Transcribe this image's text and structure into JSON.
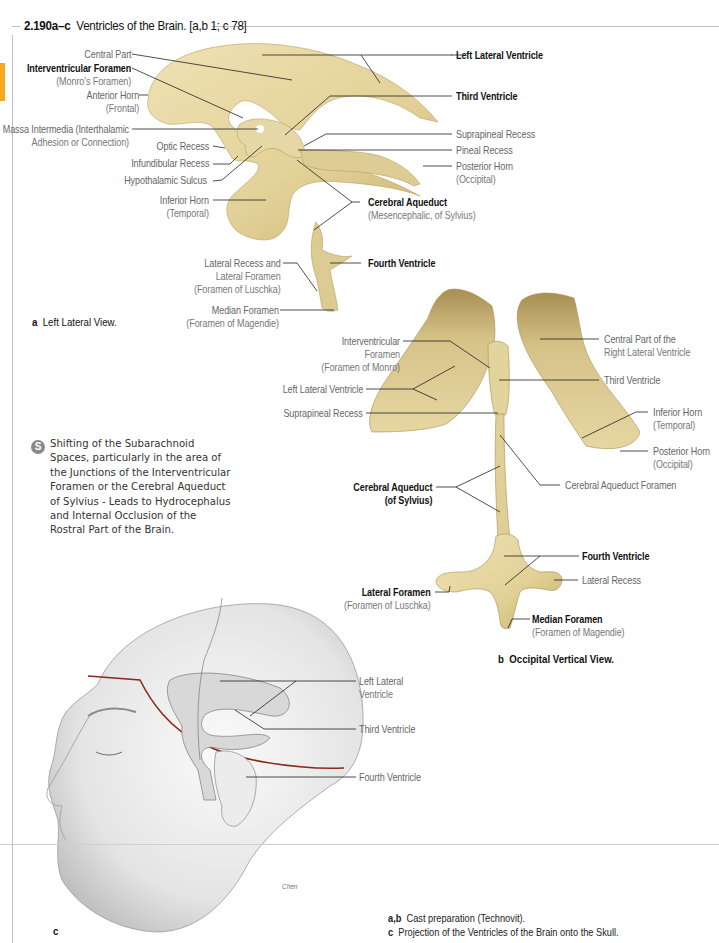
{
  "figure": {
    "number": "2.190a–c",
    "title": "Ventricles of the Brain. [a,b 1; c 78]",
    "accent_color": "#f7a823",
    "cast_color": "#e8d9a6",
    "cast_shadow": "#c9b277"
  },
  "panel_a": {
    "caption_letter": "a",
    "caption_text": "Left Lateral View.",
    "labels": [
      {
        "main": "Central Part",
        "sub": "",
        "bold": false
      },
      {
        "main": "Interventricular Foramen",
        "sub": "(Monro's Foramen)",
        "bold": true
      },
      {
        "main": "Anterior Horn",
        "sub": "(Frontal)",
        "bold": false
      },
      {
        "main": "Massa Intermedia (Interthalamic",
        "sub": "Adhesion or Connection)",
        "bold": false
      },
      {
        "main": "Optic Recess",
        "sub": "",
        "bold": false
      },
      {
        "main": "Infundibular Recess",
        "sub": "",
        "bold": false
      },
      {
        "main": "Hypothalamic Sulcus",
        "sub": "",
        "bold": false
      },
      {
        "main": "Inferior Horn",
        "sub": "(Temporal)",
        "bold": false
      },
      {
        "main": "Lateral Recess and",
        "sub": "Lateral Foramen",
        "sub2": "(Foramen of Luschka)",
        "bold": false
      },
      {
        "main": "Median Foramen",
        "sub": "(Foramen of Magendie)",
        "bold": false
      },
      {
        "main": "Left Lateral Ventricle",
        "sub": "",
        "bold": true
      },
      {
        "main": "Third Ventricle",
        "sub": "",
        "bold": true
      },
      {
        "main": "Suprapineal Recess",
        "sub": "",
        "bold": false
      },
      {
        "main": "Pineal Recess",
        "sub": "",
        "bold": false
      },
      {
        "main": "Posterior Horn",
        "sub": "(Occipital)",
        "bold": false
      },
      {
        "main": "Cerebral Aqueduct",
        "sub": "(Mesencephalic, of Sylvius)",
        "bold": true
      },
      {
        "main": "Fourth Ventricle",
        "sub": "",
        "bold": true
      }
    ]
  },
  "panel_b": {
    "caption_letter": "b",
    "caption_text": "Occipital Vertical View.",
    "labels": [
      {
        "main": "Interventricular",
        "sub": "Foramen",
        "sub2": "(Foramen of Monro)",
        "bold": false
      },
      {
        "main": "Left Lateral Ventricle",
        "sub": "",
        "bold": false
      },
      {
        "main": "Suprapineal Recess",
        "sub": "",
        "bold": false
      },
      {
        "main": "Cerebral Aqueduct",
        "sub": "(of Sylvius)",
        "bold": true
      },
      {
        "main": "Central Part of the",
        "sub": "Right Lateral Ventricle",
        "bold": false
      },
      {
        "main": "Third Ventricle",
        "sub": "",
        "bold": false
      },
      {
        "main": "Inferior Horn",
        "sub": "(Temporal)",
        "bold": false
      },
      {
        "main": "Posterior Horn",
        "sub": "(Occipital)",
        "bold": false
      },
      {
        "main": "Cerebral Aqueduct Foramen",
        "sub": "",
        "bold": false
      },
      {
        "main": "Fourth Ventricle",
        "sub": "",
        "bold": true
      },
      {
        "main": "Lateral Recess",
        "sub": "",
        "bold": false
      },
      {
        "main": "Lateral Foramen",
        "sub": "(Foramen of Luschka)",
        "bold": true
      },
      {
        "main": "Median Foramen",
        "sub": "(Foramen of Magendie)",
        "bold": true
      }
    ]
  },
  "panel_c": {
    "caption_letter": "c",
    "labels": [
      {
        "main": "Left Lateral",
        "sub": "Ventricle"
      },
      {
        "main": "Third Ventricle",
        "sub": ""
      },
      {
        "main": "Fourth Ventricle",
        "sub": ""
      }
    ],
    "signature": "Chen"
  },
  "clinical_note": {
    "icon": "clinical-note-icon",
    "text": "Shifting of the Subarachnoid Spaces,  particularly in the area of the Junctions of the Interventricular Foramen or the Cerebral Aqueduct of Sylvius - Leads to Hydrocephalus and Internal Occlusion of the Rostral Part of the Brain."
  },
  "footer": {
    "line1_key": "a,b",
    "line1_text": "Cast preparation (Technovit).",
    "line2_key": "c",
    "line2_text": "Projection of the Ventricles of the Brain onto the Skull."
  }
}
